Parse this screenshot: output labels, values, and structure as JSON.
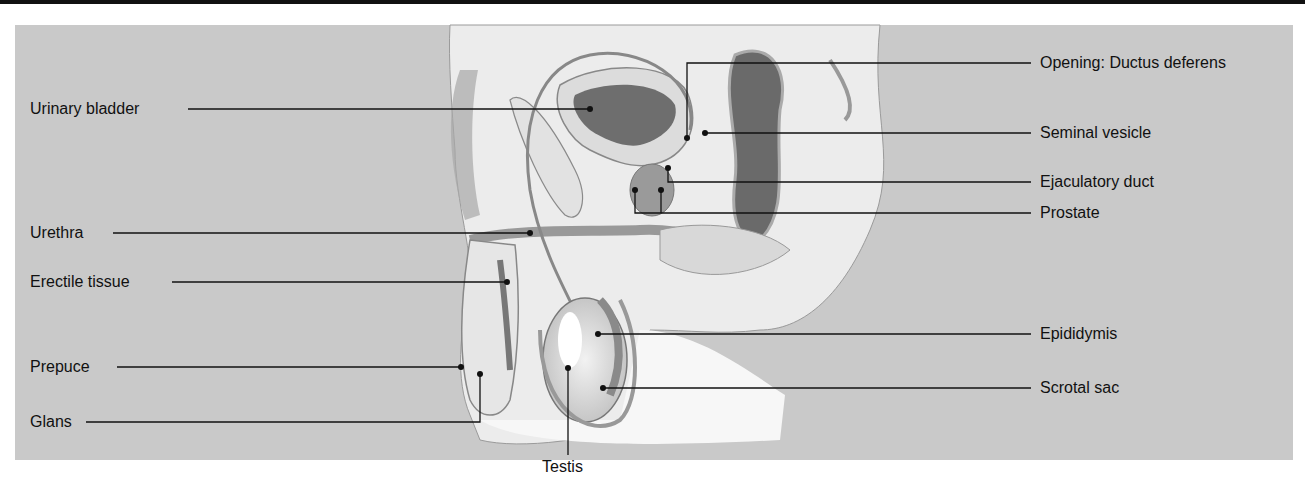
{
  "figure": {
    "colors": {
      "background_panel": "#c9c9c9",
      "line": "#111111",
      "top_rule": "#111111"
    },
    "labels_left": [
      {
        "id": "urinary-bladder",
        "text": "Urinary bladder"
      },
      {
        "id": "urethra",
        "text": "Urethra"
      },
      {
        "id": "erectile-tissue",
        "text": "Erectile tissue"
      },
      {
        "id": "prepuce",
        "text": "Prepuce"
      },
      {
        "id": "glans",
        "text": "Glans"
      }
    ],
    "labels_right": [
      {
        "id": "opening-ductus-deferens",
        "text": "Opening: Ductus deferens"
      },
      {
        "id": "seminal-vesicle",
        "text": "Seminal vesicle"
      },
      {
        "id": "ejaculatory-duct",
        "text": "Ejaculatory duct"
      },
      {
        "id": "prostate",
        "text": "Prostate"
      },
      {
        "id": "epididymis",
        "text": "Epididymis"
      },
      {
        "id": "scrotal-sac",
        "text": "Scrotal sac"
      }
    ],
    "labels_bottom": [
      {
        "id": "testis",
        "text": "Testis"
      }
    ]
  }
}
